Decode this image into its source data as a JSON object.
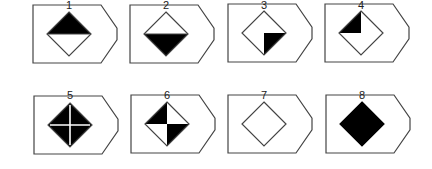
{
  "colors": {
    "stroke": "#444444",
    "fill": "#000000",
    "background": "#ffffff"
  },
  "options": [
    {
      "label": "1",
      "pattern": "top-half-black",
      "x": 33,
      "y": 5,
      "labelY": 1
    },
    {
      "label": "2",
      "pattern": "bottom-half-black",
      "x": 130,
      "y": 5,
      "labelY": 1
    },
    {
      "label": "3",
      "pattern": "bottom-right-quadrant-black",
      "x": 228,
      "y": 4,
      "labelY": 1
    },
    {
      "label": "4",
      "pattern": "top-left-quadrant-black",
      "x": 325,
      "y": 4,
      "labelY": 1
    },
    {
      "label": "5",
      "pattern": "all-black-white-cross",
      "x": 34,
      "y": 96,
      "labelY": 91
    },
    {
      "label": "6",
      "pattern": "top-left-and-bottom-right-black",
      "x": 131,
      "y": 95,
      "labelY": 91
    },
    {
      "label": "7",
      "pattern": "all-white",
      "x": 228,
      "y": 95,
      "labelY": 91
    },
    {
      "label": "8",
      "pattern": "all-black",
      "x": 326,
      "y": 95,
      "labelY": 91
    }
  ]
}
